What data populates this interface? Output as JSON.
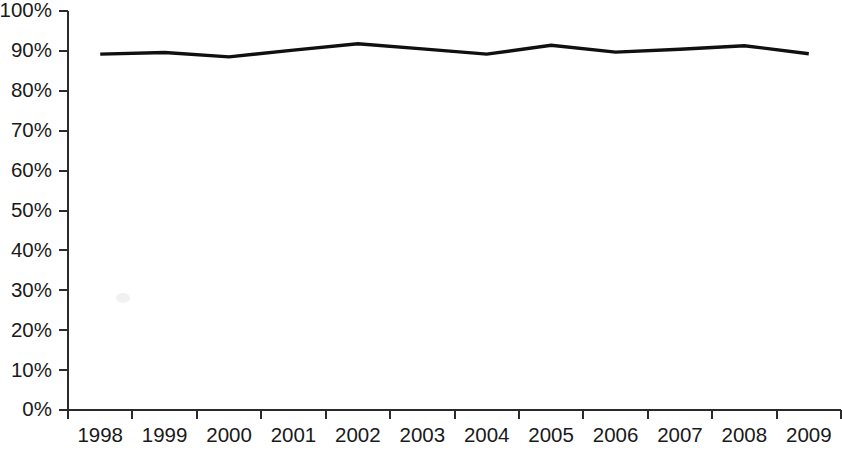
{
  "chart_data": {
    "type": "line",
    "title": "",
    "subtitle": "",
    "xlabel": "",
    "ylabel": "",
    "categories": [
      "1998",
      "1999",
      "2000",
      "2001",
      "2002",
      "2003",
      "2004",
      "2005",
      "2006",
      "2007",
      "2008",
      "2009"
    ],
    "values": [
      89.2,
      89.6,
      88.5,
      90.2,
      91.8,
      90.5,
      89.2,
      91.4,
      89.7,
      90.4,
      91.3,
      89.3
    ],
    "series": [
      {
        "name": "",
        "values": [
          89.2,
          89.6,
          88.5,
          90.2,
          91.8,
          90.5,
          89.2,
          91.4,
          89.7,
          90.4,
          91.3,
          89.3
        ]
      }
    ],
    "ylim": [
      0,
      100
    ],
    "ytick_values": [
      0,
      10,
      20,
      30,
      40,
      50,
      60,
      70,
      80,
      90,
      100
    ],
    "ytick_labels": [
      "0%",
      "10%",
      "20%",
      "30%",
      "40%",
      "50%",
      "60%",
      "70%",
      "80%",
      "90%",
      "100%"
    ],
    "xtick_labels": [
      "1998",
      "1999",
      "2000",
      "2001",
      "2002",
      "2003",
      "2004",
      "2005",
      "2006",
      "2007",
      "2008",
      "2009"
    ],
    "grid": false,
    "legend": false,
    "legend_position": "none",
    "line_color": "#101010",
    "axis_color": "#2b2b2b",
    "background_color": "#ffffff",
    "annotations": []
  },
  "axes": {
    "y_axis_name": "percentage-axis",
    "x_axis_name": "year-axis"
  }
}
